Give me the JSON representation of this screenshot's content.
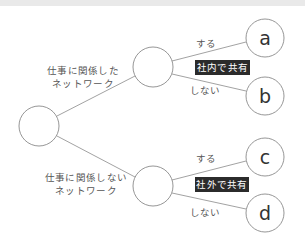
{
  "diagram": {
    "type": "decision-tree",
    "root": {
      "label": ""
    },
    "branches": [
      {
        "line1": "仕事に関係した",
        "line2": "ネットワーク",
        "share_tag": "社内で共有",
        "options": [
          {
            "edge_label": "する",
            "leaf": "a"
          },
          {
            "edge_label": "しない",
            "leaf": "b"
          }
        ]
      },
      {
        "line1": "仕事に関係しない",
        "line2": "ネットワーク",
        "share_tag": "社外で共有",
        "options": [
          {
            "edge_label": "する",
            "leaf": "c"
          },
          {
            "edge_label": "しない",
            "leaf": "d"
          }
        ]
      }
    ]
  },
  "colors": {
    "stroke": "#8a8a8a",
    "text": "#555555",
    "tag_background": "#2b2b2b",
    "tag_text": "#ffffff"
  }
}
